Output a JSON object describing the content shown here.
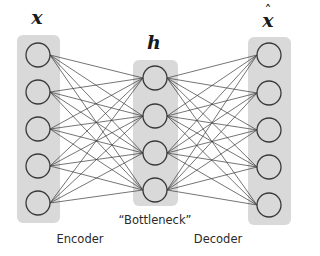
{
  "layers": [
    {
      "id": "input",
      "label": "x",
      "nodes": 5,
      "x": 38,
      "bar": {
        "x": 17,
        "y": 35,
        "w": 43,
        "h": 188
      },
      "node_y": [
        55,
        92,
        129,
        166,
        203
      ]
    },
    {
      "id": "bottleneck",
      "label": "h",
      "nodes": 4,
      "x": 155,
      "bar": {
        "x": 133,
        "y": 60,
        "w": 45,
        "h": 146
      },
      "node_y": [
        78,
        116,
        153,
        190
      ]
    },
    {
      "id": "output",
      "label": "x",
      "label_hat": "^",
      "nodes": 5,
      "x": 269,
      "bar": {
        "x": 248,
        "y": 37,
        "w": 43,
        "h": 188
      },
      "node_y": [
        55,
        93,
        130,
        167,
        205
      ]
    }
  ],
  "labels": {
    "input": "x",
    "bottleneck": "h",
    "output": "x",
    "output_hat": "ˆ",
    "bottleneck_caption": "“Bottleneck”",
    "encoder": "Encoder",
    "decoder": "Decoder"
  },
  "style": {
    "bar_color": "#d9d9d9",
    "node_fill": "#d9d9d9",
    "edge_color": "#3a3a3a",
    "node_radius": 12
  }
}
